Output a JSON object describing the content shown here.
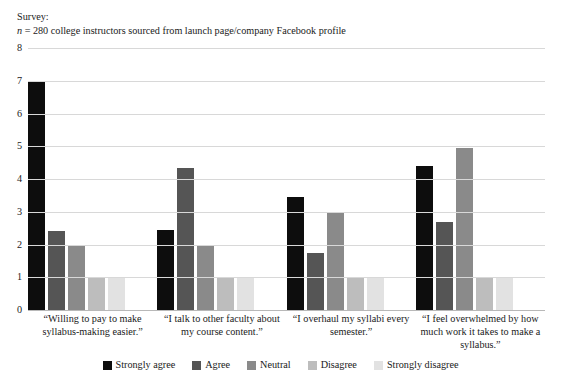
{
  "caption": {
    "line1": "Survey:",
    "n_symbol": "n",
    "line2_rest": " = 280 college instructors sourced from launch page/company Facebook profile"
  },
  "chart_data": {
    "type": "bar",
    "title": "",
    "subtitle": "",
    "xlabel": "",
    "ylabel": "",
    "ylim": [
      0,
      8
    ],
    "yticks": [
      "8",
      "7",
      "6",
      "5",
      "4",
      "3",
      "2",
      "1",
      "0"
    ],
    "grid": true,
    "legend_position": "bottom",
    "categories": [
      "“Willing to pay to make syllabus-making easier.”",
      "“I talk to other faculty about my course content.”",
      "“I overhaul my syllabi every semester.”",
      "“I feel overwhelmed by how much work it takes to make a syllabus.”"
    ],
    "series": [
      {
        "name": "Strongly agree",
        "color": "#0d0d0d",
        "values": [
          7.0,
          2.45,
          3.45,
          4.4
        ]
      },
      {
        "name": "Agree",
        "color": "#555555",
        "values": [
          2.4,
          4.35,
          1.75,
          2.7
        ]
      },
      {
        "name": "Neutral",
        "color": "#8a8a8a",
        "values": [
          2.0,
          1.95,
          2.95,
          4.95
        ]
      },
      {
        "name": "Disagree",
        "color": "#bdbdbd",
        "values": [
          1.0,
          1.0,
          1.0,
          1.0
        ]
      },
      {
        "name": "Strongly disagree",
        "color": "#e2e2e2",
        "values": [
          1.0,
          1.0,
          1.0,
          1.0
        ]
      }
    ]
  },
  "colors": {
    "gridline": "#d8d8d8",
    "baseline": "#b8b8b8",
    "text": "#1a1a1a"
  }
}
